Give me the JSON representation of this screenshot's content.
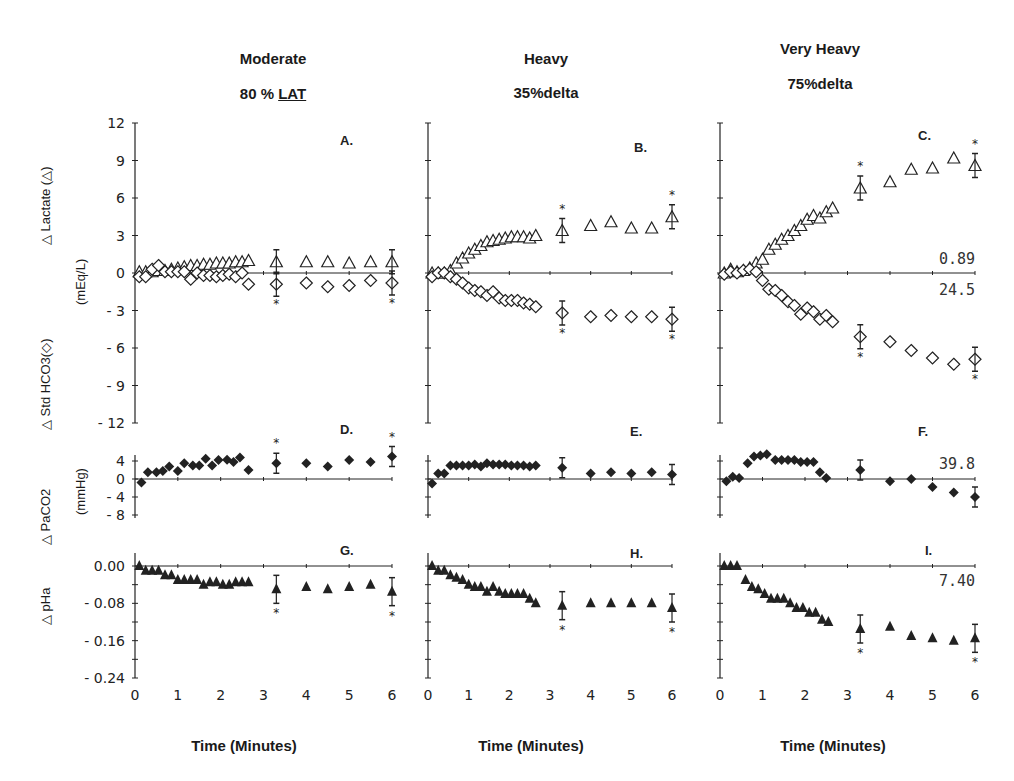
{
  "columns": [
    {
      "title": "Moderate",
      "subtitle": "80 % ",
      "subtitle_underlined": "LAT"
    },
    {
      "title": "Heavy",
      "subtitle": "35%delta",
      "subtitle_underlined": ""
    },
    {
      "title": "Very Heavy",
      "subtitle": "75%delta",
      "subtitle_underlined": ""
    }
  ],
  "row_labels": {
    "lactate_hco3": {
      "top": "△ Lactate (△)",
      "bottom": "△ Std HCO3(◇)",
      "unit": "(mEq/L)"
    },
    "paco2": {
      "label": "△ PaCO2",
      "unit": "(mmHg)"
    },
    "pha": {
      "label": "△ pHa"
    }
  },
  "xlabel": "Time (Minutes)",
  "chart_data": [
    {
      "panel": "A.",
      "type": "scatter",
      "title": "Moderate 80 % LAT",
      "xlabel": "",
      "ylabel": "Δ Lactate / Δ Std HCO3 (mEq/L)",
      "ylim": [
        -12,
        12
      ],
      "yticks": [
        12,
        9,
        6,
        3,
        0,
        -3,
        -6,
        -9,
        -12
      ],
      "xlim": [
        0,
        6
      ],
      "series": [
        {
          "name": "Δ Lactate",
          "marker": "open-triangle",
          "x": [
            0.1,
            0.25,
            0.4,
            0.55,
            0.7,
            0.85,
            1.0,
            1.15,
            1.3,
            1.45,
            1.6,
            1.75,
            1.9,
            2.05,
            2.2,
            2.35,
            2.5,
            2.65,
            3.3,
            4.0,
            4.5,
            5.0,
            5.5,
            6.0
          ],
          "y": [
            0.1,
            0.1,
            0.1,
            0.2,
            0.2,
            0.3,
            0.4,
            0.5,
            0.6,
            0.6,
            0.7,
            0.7,
            0.8,
            0.8,
            0.8,
            0.9,
            0.9,
            1.0,
            0.9,
            0.9,
            0.9,
            0.8,
            0.9,
            0.9
          ]
        },
        {
          "name": "Δ Std HCO3",
          "marker": "open-diamond",
          "x": [
            0.1,
            0.25,
            0.4,
            0.55,
            0.7,
            0.85,
            1.0,
            1.15,
            1.3,
            1.45,
            1.6,
            1.75,
            1.9,
            2.05,
            2.2,
            2.35,
            2.5,
            2.65,
            3.3,
            4.0,
            4.5,
            5.0,
            5.5,
            6.0
          ],
          "y": [
            -0.3,
            -0.3,
            0.3,
            0.6,
            0.1,
            0.1,
            0.1,
            0.1,
            -0.5,
            0.0,
            -0.2,
            -0.2,
            -0.3,
            -0.2,
            -0.1,
            -0.3,
            0.0,
            -0.9,
            -0.9,
            -0.8,
            -1.1,
            -1.0,
            -0.6,
            -0.8
          ]
        }
      ],
      "error_bars_at": [
        3.3,
        6.0
      ],
      "significance_markers": [
        "*",
        "*"
      ]
    },
    {
      "panel": "B.",
      "type": "scatter",
      "title": "Heavy 35%delta",
      "ylim": [
        -12,
        12
      ],
      "xlim": [
        0,
        6
      ],
      "series": [
        {
          "name": "Δ Lactate",
          "marker": "open-triangle",
          "x": [
            0.1,
            0.25,
            0.4,
            0.55,
            0.7,
            0.85,
            1.0,
            1.15,
            1.3,
            1.45,
            1.6,
            1.75,
            1.9,
            2.05,
            2.2,
            2.35,
            2.5,
            2.65,
            3.3,
            4.0,
            4.5,
            5.0,
            5.5,
            6.0
          ],
          "y": [
            0.0,
            0.0,
            0.0,
            0.2,
            0.8,
            1.2,
            1.6,
            1.9,
            2.2,
            2.5,
            2.6,
            2.7,
            2.8,
            2.9,
            2.9,
            2.9,
            2.8,
            3.0,
            3.4,
            3.8,
            4.1,
            3.6,
            3.6,
            4.5
          ]
        },
        {
          "name": "Δ Std HCO3",
          "marker": "open-diamond",
          "x": [
            0.1,
            0.25,
            0.4,
            0.55,
            0.7,
            0.85,
            1.0,
            1.15,
            1.3,
            1.45,
            1.6,
            1.75,
            1.9,
            2.05,
            2.2,
            2.35,
            2.5,
            2.65,
            3.3,
            4.0,
            4.5,
            5.0,
            5.5,
            6.0
          ],
          "y": [
            -0.3,
            0.0,
            0.0,
            -0.3,
            -0.5,
            -0.8,
            -1.2,
            -1.4,
            -1.5,
            -1.8,
            -1.5,
            -2.0,
            -2.2,
            -2.2,
            -2.2,
            -2.4,
            -2.5,
            -2.7,
            -3.2,
            -3.5,
            -3.4,
            -3.5,
            -3.5,
            -3.7
          ]
        }
      ],
      "error_bars_at": [
        3.3,
        6.0
      ],
      "significance_markers": [
        "*",
        "*",
        "*",
        "*"
      ]
    },
    {
      "panel": "C.",
      "type": "scatter",
      "title": "Very Heavy 75%delta",
      "ylim": [
        -12,
        12
      ],
      "xlim": [
        0,
        6
      ],
      "reference_labels": {
        "lactate_baseline": "0.89",
        "hco3_baseline": "24.5"
      },
      "series": [
        {
          "name": "Δ Lactate",
          "marker": "open-triangle",
          "x": [
            0.1,
            0.25,
            0.4,
            0.55,
            0.7,
            0.85,
            1.0,
            1.15,
            1.3,
            1.45,
            1.6,
            1.75,
            1.9,
            2.05,
            2.2,
            2.35,
            2.5,
            2.65,
            3.3,
            4.0,
            4.5,
            5.0,
            5.5,
            6.0
          ],
          "y": [
            0.0,
            0.3,
            0.1,
            0.2,
            0.4,
            0.8,
            1.1,
            1.9,
            2.3,
            2.7,
            3.0,
            3.4,
            3.8,
            4.3,
            4.6,
            4.4,
            4.9,
            5.2,
            6.8,
            7.3,
            8.3,
            8.4,
            9.2,
            8.6
          ]
        },
        {
          "name": "Δ Std HCO3",
          "marker": "open-diamond",
          "x": [
            0.1,
            0.25,
            0.4,
            0.55,
            0.7,
            0.85,
            1.0,
            1.15,
            1.3,
            1.45,
            1.6,
            1.75,
            1.9,
            2.05,
            2.2,
            2.35,
            2.5,
            2.65,
            3.3,
            4.0,
            4.5,
            5.0,
            5.5,
            6.0
          ],
          "y": [
            -0.1,
            0.1,
            0.0,
            0.2,
            0.3,
            0.1,
            -0.6,
            -1.3,
            -1.4,
            -1.8,
            -2.3,
            -2.6,
            -3.3,
            -2.8,
            -3.1,
            -3.7,
            -3.4,
            -3.9,
            -5.1,
            -5.5,
            -6.2,
            -6.8,
            -7.3,
            -6.9
          ]
        }
      ],
      "error_bars_at": [
        3.3,
        6.0
      ],
      "significance_markers": [
        "*",
        "*",
        "*",
        "*"
      ]
    },
    {
      "panel": "D.",
      "type": "scatter",
      "ylabel": "Δ PaCO2 (mmHg)",
      "ylim": [
        -8,
        4
      ],
      "yticks": [
        4,
        0,
        -4,
        -8
      ],
      "xlim": [
        0,
        6
      ],
      "series": [
        {
          "name": "Δ PaCO2",
          "marker": "filled-diamond",
          "x": [
            0.15,
            0.3,
            0.5,
            0.65,
            0.8,
            1.0,
            1.15,
            1.35,
            1.5,
            1.65,
            1.8,
            1.95,
            2.15,
            2.3,
            2.45,
            2.65,
            3.3,
            4.0,
            4.5,
            5.0,
            5.5,
            6.0
          ],
          "y": [
            -0.8,
            1.5,
            1.5,
            1.8,
            2.8,
            1.8,
            3.5,
            3.0,
            3.0,
            4.5,
            3.0,
            4.2,
            4.3,
            3.8,
            4.8,
            2.0,
            3.5,
            3.5,
            2.8,
            4.2,
            3.8,
            5.0
          ]
        }
      ],
      "error_bars_at": [
        3.3,
        6.0
      ],
      "significance_markers": [
        "*",
        "*"
      ]
    },
    {
      "panel": "E.",
      "type": "scatter",
      "ylim": [
        -8,
        4
      ],
      "xlim": [
        0,
        6
      ],
      "series": [
        {
          "name": "Δ PaCO2",
          "marker": "filled-diamond",
          "x": [
            0.1,
            0.25,
            0.4,
            0.55,
            0.7,
            0.85,
            1.0,
            1.15,
            1.3,
            1.45,
            1.6,
            1.75,
            1.9,
            2.05,
            2.2,
            2.35,
            2.5,
            2.65,
            3.3,
            4.0,
            4.5,
            5.0,
            5.5,
            6.0
          ],
          "y": [
            -1.0,
            1.2,
            1.2,
            3.0,
            3.0,
            3.0,
            3.0,
            3.2,
            2.8,
            3.5,
            3.2,
            3.2,
            3.2,
            3.0,
            3.0,
            3.0,
            2.8,
            3.0,
            2.5,
            1.2,
            1.5,
            1.2,
            1.5,
            1.0
          ]
        }
      ],
      "error_bars_at": [
        3.3,
        6.0
      ]
    },
    {
      "panel": "F.",
      "type": "scatter",
      "ylim": [
        -8,
        4
      ],
      "xlim": [
        0,
        6
      ],
      "reference_labels": {
        "paco2_baseline": "39.8"
      },
      "series": [
        {
          "name": "Δ PaCO2",
          "marker": "filled-diamond",
          "x": [
            0.15,
            0.3,
            0.45,
            0.65,
            0.8,
            0.95,
            1.1,
            1.3,
            1.45,
            1.6,
            1.75,
            1.9,
            2.05,
            2.2,
            2.35,
            2.5,
            3.3,
            4.0,
            4.5,
            5.0,
            5.5,
            6.0
          ],
          "y": [
            -0.5,
            0.5,
            0.2,
            3.5,
            5.0,
            5.2,
            5.5,
            4.2,
            4.2,
            4.2,
            4.2,
            3.8,
            3.8,
            3.8,
            1.5,
            0.2,
            2.0,
            -0.5,
            0.0,
            -1.8,
            -3.0,
            -4.0
          ]
        }
      ],
      "error_bars_at": [
        3.3,
        6.0
      ]
    },
    {
      "panel": "G.",
      "type": "scatter",
      "ylabel": "Δ pHa",
      "ylim": [
        -0.24,
        0.02
      ],
      "yticks": [
        0.0,
        -0.08,
        -0.16,
        -0.24
      ],
      "xlim": [
        0,
        6
      ],
      "xticks": [
        0,
        1,
        2,
        3,
        4,
        5,
        6
      ],
      "xlabel": "Time (Minutes)",
      "series": [
        {
          "name": "Δ pHa",
          "marker": "filled-triangle",
          "x": [
            0.1,
            0.25,
            0.4,
            0.55,
            0.7,
            0.85,
            1.0,
            1.15,
            1.3,
            1.45,
            1.6,
            1.75,
            1.9,
            2.05,
            2.2,
            2.35,
            2.5,
            2.65,
            3.3,
            4.0,
            4.5,
            5.0,
            5.5,
            6.0
          ],
          "y": [
            0.0,
            -0.01,
            -0.01,
            -0.01,
            -0.02,
            -0.02,
            -0.03,
            -0.03,
            -0.03,
            -0.03,
            -0.04,
            -0.035,
            -0.035,
            -0.04,
            -0.04,
            -0.035,
            -0.035,
            -0.035,
            -0.05,
            -0.045,
            -0.05,
            -0.045,
            -0.04,
            -0.055
          ]
        }
      ],
      "error_bars_at": [
        3.3,
        6.0
      ],
      "significance_markers": [
        "*",
        "*"
      ]
    },
    {
      "panel": "H.",
      "type": "scatter",
      "ylim": [
        -0.24,
        0.02
      ],
      "xlim": [
        0,
        6
      ],
      "xticks": [
        0,
        1,
        2,
        3,
        4,
        5,
        6
      ],
      "xlabel": "Time (Minutes)",
      "series": [
        {
          "name": "Δ pHa",
          "marker": "filled-triangle",
          "x": [
            0.1,
            0.25,
            0.4,
            0.55,
            0.7,
            0.85,
            1.0,
            1.15,
            1.3,
            1.45,
            1.6,
            1.75,
            1.9,
            2.05,
            2.2,
            2.35,
            2.5,
            2.65,
            3.3,
            4.0,
            4.5,
            5.0,
            5.5,
            6.0
          ],
          "y": [
            0.0,
            -0.01,
            -0.01,
            -0.02,
            -0.025,
            -0.03,
            -0.04,
            -0.045,
            -0.045,
            -0.055,
            -0.045,
            -0.055,
            -0.06,
            -0.06,
            -0.06,
            -0.06,
            -0.07,
            -0.08,
            -0.085,
            -0.08,
            -0.08,
            -0.08,
            -0.08,
            -0.09
          ]
        }
      ],
      "error_bars_at": [
        3.3,
        6.0
      ],
      "significance_markers": [
        "*",
        "*"
      ]
    },
    {
      "panel": "I.",
      "type": "scatter",
      "ylim": [
        -0.24,
        0.02
      ],
      "xlim": [
        0,
        6
      ],
      "xticks": [
        0,
        1,
        2,
        3,
        4,
        5,
        6
      ],
      "xlabel": "Time (Minutes)",
      "reference_labels": {
        "ph_baseline": "7.40"
      },
      "series": [
        {
          "name": "Δ pHa",
          "marker": "filled-triangle",
          "x": [
            0.1,
            0.25,
            0.4,
            0.6,
            0.75,
            0.9,
            1.05,
            1.2,
            1.35,
            1.5,
            1.65,
            1.8,
            1.95,
            2.1,
            2.25,
            2.4,
            2.55,
            3.3,
            4.0,
            4.5,
            5.0,
            5.5,
            6.0
          ],
          "y": [
            0.0,
            0.0,
            0.0,
            -0.03,
            -0.045,
            -0.05,
            -0.06,
            -0.07,
            -0.07,
            -0.07,
            -0.08,
            -0.09,
            -0.09,
            -0.1,
            -0.1,
            -0.115,
            -0.12,
            -0.135,
            -0.13,
            -0.15,
            -0.155,
            -0.16,
            -0.155
          ]
        }
      ],
      "error_bars_at": [
        3.3,
        6.0
      ],
      "significance_markers": [
        "*",
        "*"
      ]
    }
  ]
}
